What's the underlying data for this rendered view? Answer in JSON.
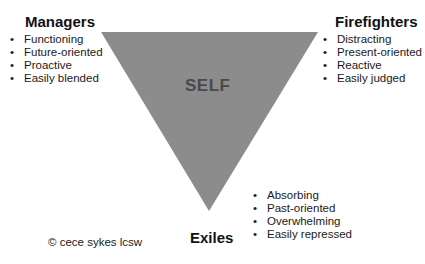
{
  "diagram": {
    "center_label": "SELF",
    "triangle_fill": "#8c8c8c",
    "center_label_color": "#4a4a4a",
    "managers": {
      "title": "Managers",
      "items": [
        "Functioning",
        "Future-oriented",
        "Proactive",
        "Easily blended"
      ]
    },
    "firefighters": {
      "title": "Firefighters",
      "items": [
        "Distracting",
        "Present-oriented",
        "Reactive",
        "Easily judged"
      ]
    },
    "exiles": {
      "title": "Exiles",
      "items": [
        "Absorbing",
        "Past-oriented",
        "Overwhelming",
        "Easily repressed"
      ]
    },
    "bullet": "•",
    "copyright": "© cece sykes lcsw"
  }
}
